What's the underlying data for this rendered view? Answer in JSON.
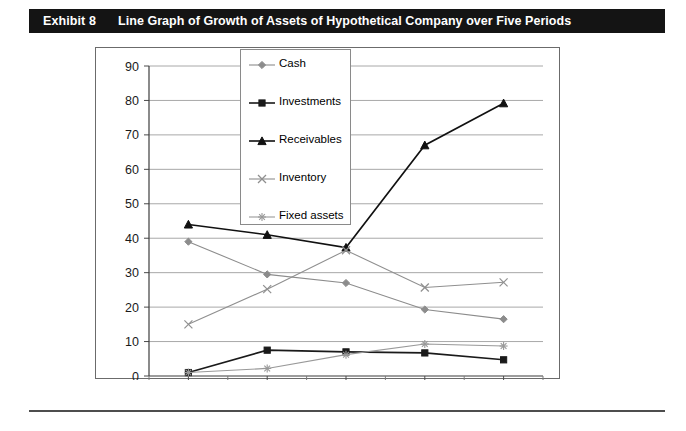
{
  "exhibit": {
    "label": "Exhibit 8",
    "title": "Line Graph of Growth of Assets of Hypothetical Company over Five Periods"
  },
  "chart_data": {
    "type": "line",
    "title": "Line Graph of Growth of Assets of Hypothetical Company over Five Periods",
    "xlabel": "",
    "ylabel": "",
    "categories": [
      "1",
      "2",
      "3",
      "4",
      "5"
    ],
    "x": [
      1,
      2,
      3,
      4,
      5
    ],
    "ylim": [
      0,
      90
    ],
    "yticks": [
      0,
      10,
      20,
      30,
      40,
      50,
      60,
      70,
      80,
      90
    ],
    "grid": true,
    "legend_position": "inside-top-center",
    "series": [
      {
        "name": "Cash",
        "marker": "diamond",
        "color": "#8c8c8c",
        "values": [
          39.0,
          29.5,
          27.0,
          19.3,
          16.5
        ]
      },
      {
        "name": "Investments",
        "marker": "square",
        "color": "#1a1a1a",
        "values": [
          1.0,
          7.5,
          7.0,
          6.7,
          4.7
        ]
      },
      {
        "name": "Receivables",
        "marker": "triangle",
        "color": "#111111",
        "values": [
          44.0,
          41.0,
          37.3,
          67.0,
          79.2
        ]
      },
      {
        "name": "Inventory",
        "marker": "x",
        "color": "#8f8f8f",
        "values": [
          15.0,
          25.2,
          36.5,
          25.7,
          27.2
        ]
      },
      {
        "name": "Fixed assets",
        "marker": "asterisk",
        "color": "#999999",
        "values": [
          1.0,
          2.2,
          6.2,
          9.3,
          8.7
        ]
      }
    ]
  }
}
